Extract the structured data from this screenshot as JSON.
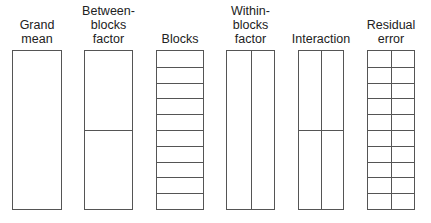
{
  "diagram": {
    "title": "",
    "columns": [
      {
        "id": "grand-mean",
        "label_lines": [
          "Grand",
          "mean"
        ],
        "rows": 1,
        "cols": 1
      },
      {
        "id": "between-blocks-factor",
        "label_lines": [
          "Between-",
          "blocks",
          "factor"
        ],
        "rows": 2,
        "cols": 1
      },
      {
        "id": "blocks",
        "label_lines": [
          "Blocks"
        ],
        "rows": 10,
        "cols": 1
      },
      {
        "id": "within-blocks-factor",
        "label_lines": [
          "Within-",
          "blocks",
          "factor"
        ],
        "rows": 1,
        "cols": 2
      },
      {
        "id": "interaction",
        "label_lines": [
          "Interaction"
        ],
        "rows": 2,
        "cols": 2
      },
      {
        "id": "residual-error",
        "label_lines": [
          "Residual",
          "error"
        ],
        "rows": 10,
        "cols": 2
      }
    ],
    "labels": {
      "c0": "Grand\nmean",
      "c1": "Between-\nblocks\nfactor",
      "c2": "Blocks",
      "c3": "Within-\nblocks\nfactor",
      "c4": "Interaction",
      "c5": "Residual\nerror"
    },
    "line_color": "#555555"
  }
}
